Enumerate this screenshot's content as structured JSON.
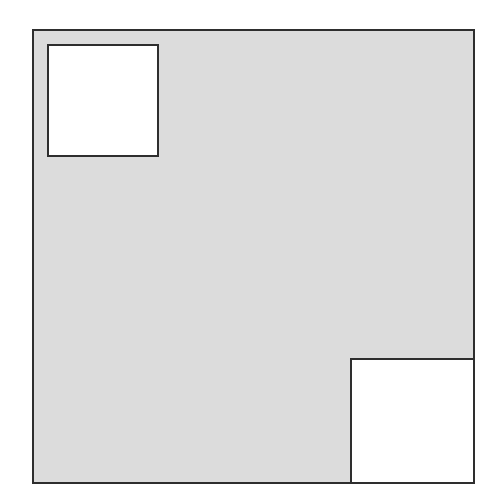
{
  "diagram": {
    "colors": {
      "background": "#ffffff",
      "outer_fill": "#dcdcdc",
      "inner_fill": "#ffffff",
      "stroke": "#2e2e2e"
    },
    "outer_square": {
      "x": 33,
      "y": 30,
      "width": 441,
      "height": 453
    },
    "small_squares": [
      {
        "name": "top-left-square",
        "x": 48,
        "y": 45,
        "width": 110,
        "height": 111
      },
      {
        "name": "bottom-right-square",
        "x": 351,
        "y": 359,
        "width": 123,
        "height": 124
      }
    ]
  }
}
